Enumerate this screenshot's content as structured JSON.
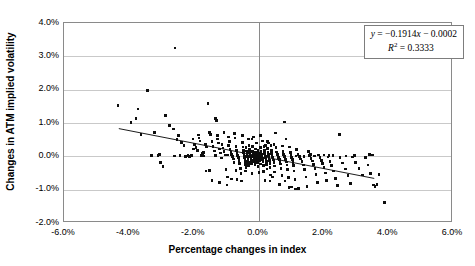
{
  "chart_data": {
    "type": "scatter",
    "title": "",
    "xlabel": "Percentage changes in index",
    "ylabel": "Changes in ATM implied volatility",
    "xlim": [
      -6.0,
      6.0
    ],
    "ylim": [
      -2.0,
      4.0
    ],
    "xticks": [
      "-6.0%",
      "-4.0%",
      "-2.0%",
      "0.0%",
      "2.0%",
      "4.0%",
      "6.0%"
    ],
    "xtick_values": [
      -6.0,
      -4.0,
      -2.0,
      0.0,
      2.0,
      4.0,
      6.0
    ],
    "yticks": [
      "-2.0%",
      "-1.0%",
      "0.0%",
      "1.0%",
      "2.0%",
      "3.0%",
      "4.0%"
    ],
    "ytick_values": [
      -2.0,
      -1.0,
      0.0,
      1.0,
      2.0,
      3.0,
      4.0
    ],
    "grid": "horizontal",
    "legend": "none",
    "marker": "square",
    "marker_color": "#0d0d0d",
    "annotation": {
      "equation": "y = -0.1914x - 0.0002",
      "r_squared": "R2 = 0.3333",
      "equation_prefix": "y",
      "equation_body": " = −0.1914",
      "equation_var": "x",
      "equation_suffix": " − 0.0002",
      "r_prefix": "R",
      "r_exp": "2",
      "r_value": " = 0.3333",
      "position": "top-right"
    },
    "trendline": {
      "slope": -0.1914,
      "intercept": -0.0002,
      "r_squared": 0.3333,
      "x_start": -4.3,
      "y_start": 0.8,
      "x_end": 3.62,
      "y_end": -0.71,
      "color": "#1a1a1a"
    },
    "points": [
      [
        -4.33,
        1.53
      ],
      [
        -3.93,
        1.02
      ],
      [
        -3.72,
        1.42
      ],
      [
        -3.78,
        1.13
      ],
      [
        -3.42,
        1.98
      ],
      [
        -3.62,
        0.66
      ],
      [
        -3.2,
        0.71
      ],
      [
        -3.05,
        0.06
      ],
      [
        -3.02,
        -0.18
      ],
      [
        -2.95,
        -0.31
      ],
      [
        -2.86,
        1.22
      ],
      [
        -2.74,
        0.92
      ],
      [
        -2.58,
        3.25
      ],
      [
        -2.62,
        0.82
      ],
      [
        -2.52,
        0.51
      ],
      [
        -2.46,
        0.62
      ],
      [
        -2.38,
        0.42
      ],
      [
        -2.3,
        0.33
      ],
      [
        -2.22,
        0.01
      ],
      [
        -2.18,
        0.02
      ],
      [
        -2.12,
        0.0
      ],
      [
        -2.07,
        0.03
      ],
      [
        -2.02,
        0.52
      ],
      [
        -1.98,
        0.35
      ],
      [
        -1.93,
        0.26
      ],
      [
        -1.88,
        0.18
      ],
      [
        -1.84,
        0.55
      ],
      [
        -1.8,
        0.46
      ],
      [
        -1.76,
        0.02
      ],
      [
        -1.72,
        0.08
      ],
      [
        -1.68,
        0.01
      ],
      [
        -1.64,
        0.35
      ],
      [
        -1.6,
        0.28
      ],
      [
        -1.56,
        1.58
      ],
      [
        -1.52,
        0.72
      ],
      [
        -1.48,
        0.66
      ],
      [
        -1.44,
        0.45
      ],
      [
        -1.4,
        0.3
      ],
      [
        -1.36,
        0.16
      ],
      [
        -1.33,
        1.13
      ],
      [
        -1.3,
        1.07
      ],
      [
        -1.27,
        0.62
      ],
      [
        -1.24,
        0.4
      ],
      [
        -1.21,
        0.22
      ],
      [
        -1.18,
        0.1
      ],
      [
        -1.15,
        -0.05
      ],
      [
        -1.12,
        0.36
      ],
      [
        -1.09,
        0.25
      ],
      [
        -1.06,
        0.14
      ],
      [
        -1.03,
        0.04
      ],
      [
        -1.0,
        -0.39
      ],
      [
        -0.97,
        -0.86
      ],
      [
        -0.95,
        -0.62
      ],
      [
        -0.92,
        0.33
      ],
      [
        -0.9,
        0.45
      ],
      [
        -0.88,
        0.21
      ],
      [
        -0.85,
        0.12
      ],
      [
        -0.83,
        0.06
      ],
      [
        -0.8,
        0.0
      ],
      [
        -0.78,
        -0.08
      ],
      [
        -0.76,
        -0.18
      ],
      [
        -0.74,
        0.68
      ],
      [
        -0.72,
        0.55
      ],
      [
        -0.7,
        0.3
      ],
      [
        -0.68,
        0.17
      ],
      [
        -0.66,
        0.08
      ],
      [
        -0.64,
        0.02
      ],
      [
        -0.62,
        -0.04
      ],
      [
        -0.6,
        -0.12
      ],
      [
        -0.58,
        -0.22
      ],
      [
        -0.56,
        -0.36
      ],
      [
        -0.54,
        -0.52
      ],
      [
        -0.52,
        -0.74
      ],
      [
        -0.5,
        0.42
      ],
      [
        -0.48,
        0.28
      ],
      [
        -0.47,
        0.19
      ],
      [
        -0.46,
        0.11
      ],
      [
        -0.45,
        0.05
      ],
      [
        -0.44,
        0.0
      ],
      [
        -0.43,
        -0.03
      ],
      [
        -0.42,
        -0.09
      ],
      [
        -0.41,
        -0.15
      ],
      [
        -0.4,
        -0.24
      ],
      [
        -0.39,
        -0.33
      ],
      [
        -0.38,
        0.26
      ],
      [
        -0.37,
        0.16
      ],
      [
        -0.36,
        0.09
      ],
      [
        -0.35,
        0.03
      ],
      [
        -0.34,
        -0.01
      ],
      [
        -0.33,
        -0.06
      ],
      [
        -0.32,
        -0.11
      ],
      [
        -0.31,
        -0.19
      ],
      [
        -0.3,
        -0.28
      ],
      [
        -0.29,
        0.33
      ],
      [
        -0.28,
        0.2
      ],
      [
        -0.27,
        0.12
      ],
      [
        -0.26,
        0.06
      ],
      [
        -0.25,
        0.01
      ],
      [
        -0.24,
        -0.02
      ],
      [
        -0.23,
        -0.07
      ],
      [
        -0.22,
        -0.13
      ],
      [
        -0.21,
        -0.21
      ],
      [
        -0.2,
        0.52
      ],
      [
        -0.19,
        0.29
      ],
      [
        -0.18,
        0.15
      ],
      [
        -0.17,
        0.08
      ],
      [
        -0.16,
        0.03
      ],
      [
        -0.15,
        0.0
      ],
      [
        -0.14,
        -0.04
      ],
      [
        -0.13,
        -0.09
      ],
      [
        -0.12,
        -0.16
      ],
      [
        -0.11,
        -0.25
      ],
      [
        -0.1,
        0.22
      ],
      [
        -0.09,
        0.11
      ],
      [
        -0.08,
        0.05
      ],
      [
        -0.07,
        0.01
      ],
      [
        -0.06,
        -0.02
      ],
      [
        -0.05,
        -0.06
      ],
      [
        -0.04,
        -0.12
      ],
      [
        -0.03,
        -0.2
      ],
      [
        -0.02,
        -0.31
      ],
      [
        -0.01,
        0.18
      ],
      [
        0.0,
        0.09
      ],
      [
        0.01,
        0.04
      ],
      [
        0.02,
        0.0
      ],
      [
        0.03,
        -0.03
      ],
      [
        0.04,
        -0.08
      ],
      [
        0.05,
        -0.14
      ],
      [
        0.06,
        -0.23
      ],
      [
        0.07,
        0.26
      ],
      [
        0.08,
        0.14
      ],
      [
        0.09,
        0.07
      ],
      [
        0.1,
        0.02
      ],
      [
        0.11,
        -0.01
      ],
      [
        0.12,
        -0.05
      ],
      [
        0.13,
        -0.1
      ],
      [
        0.14,
        -0.17
      ],
      [
        0.15,
        -0.27
      ],
      [
        0.16,
        -0.45
      ],
      [
        0.17,
        0.3
      ],
      [
        0.18,
        0.17
      ],
      [
        0.19,
        0.09
      ],
      [
        0.2,
        0.03
      ],
      [
        0.21,
        0.0
      ],
      [
        0.22,
        -0.04
      ],
      [
        0.23,
        -0.09
      ],
      [
        0.24,
        -0.15
      ],
      [
        0.25,
        -0.24
      ],
      [
        0.26,
        -0.38
      ],
      [
        0.27,
        0.44
      ],
      [
        0.28,
        0.23
      ],
      [
        0.29,
        0.12
      ],
      [
        0.3,
        0.05
      ],
      [
        0.31,
        0.01
      ],
      [
        0.32,
        -0.03
      ],
      [
        0.33,
        -0.07
      ],
      [
        0.34,
        -0.13
      ],
      [
        0.35,
        -0.21
      ],
      [
        0.36,
        -0.34
      ],
      [
        0.37,
        -0.56
      ],
      [
        0.38,
        0.33
      ],
      [
        0.4,
        0.18
      ],
      [
        0.41,
        0.08
      ],
      [
        0.42,
        0.02
      ],
      [
        0.44,
        -0.02
      ],
      [
        0.45,
        -0.06
      ],
      [
        0.46,
        -0.11
      ],
      [
        0.48,
        -0.18
      ],
      [
        0.49,
        -0.29
      ],
      [
        0.5,
        -0.47
      ],
      [
        0.52,
        0.7
      ],
      [
        0.54,
        0.26
      ],
      [
        0.56,
        0.13
      ],
      [
        0.58,
        0.05
      ],
      [
        0.6,
        0.0
      ],
      [
        0.62,
        -0.04
      ],
      [
        0.64,
        -0.09
      ],
      [
        0.66,
        -0.15
      ],
      [
        0.68,
        -0.23
      ],
      [
        0.7,
        -0.36
      ],
      [
        0.72,
        -0.58
      ],
      [
        0.74,
        0.31
      ],
      [
        0.76,
        0.15
      ],
      [
        0.78,
        0.06
      ],
      [
        0.8,
        0.0
      ],
      [
        0.82,
        -0.05
      ],
      [
        0.84,
        -0.1
      ],
      [
        0.86,
        -0.17
      ],
      [
        0.88,
        -0.26
      ],
      [
        0.9,
        -0.4
      ],
      [
        0.92,
        -0.64
      ],
      [
        0.94,
        -0.94
      ],
      [
        0.8,
        1.03
      ],
      [
        0.85,
        0.52
      ],
      [
        0.96,
        0.28
      ],
      [
        0.98,
        0.12
      ],
      [
        1.0,
        0.02
      ],
      [
        1.02,
        -0.04
      ],
      [
        1.04,
        -0.1
      ],
      [
        1.06,
        -0.18
      ],
      [
        1.08,
        -0.28
      ],
      [
        1.1,
        -0.44
      ],
      [
        1.12,
        -0.7
      ],
      [
        1.14,
        -0.98
      ],
      [
        1.18,
        0.2
      ],
      [
        1.22,
        0.06
      ],
      [
        1.26,
        -0.01
      ],
      [
        1.3,
        -0.08
      ],
      [
        1.34,
        -0.16
      ],
      [
        1.38,
        -0.26
      ],
      [
        1.42,
        -0.4
      ],
      [
        1.46,
        -0.62
      ],
      [
        1.5,
        -0.9
      ],
      [
        1.54,
        0.14
      ],
      [
        1.58,
        0.02
      ],
      [
        1.62,
        -0.06
      ],
      [
        1.66,
        -0.14
      ],
      [
        1.7,
        -0.24
      ],
      [
        1.74,
        -0.36
      ],
      [
        1.78,
        -0.54
      ],
      [
        1.82,
        -0.78
      ],
      [
        1.86,
        0.04
      ],
      [
        1.9,
        -0.03
      ],
      [
        1.94,
        -0.12
      ],
      [
        1.98,
        -0.22
      ],
      [
        2.02,
        -0.34
      ],
      [
        2.06,
        -0.5
      ],
      [
        2.1,
        -0.72
      ],
      [
        2.14,
        -0.02
      ],
      [
        2.2,
        -0.15
      ],
      [
        2.26,
        -0.28
      ],
      [
        2.32,
        -0.44
      ],
      [
        2.38,
        -0.66
      ],
      [
        2.44,
        -0.88
      ],
      [
        2.5,
        0.66
      ],
      [
        2.52,
        -0.04
      ],
      [
        2.6,
        -0.2
      ],
      [
        2.68,
        -0.38
      ],
      [
        2.76,
        -0.58
      ],
      [
        2.84,
        -0.82
      ],
      [
        2.9,
        -0.02
      ],
      [
        3.0,
        -0.18
      ],
      [
        3.1,
        -0.36
      ],
      [
        3.2,
        -0.56
      ],
      [
        3.3,
        -0.03
      ],
      [
        3.38,
        -0.26
      ],
      [
        3.46,
        -0.52
      ],
      [
        3.54,
        -0.86
      ],
      [
        3.6,
        -0.9
      ],
      [
        3.66,
        -0.84
      ],
      [
        3.72,
        -0.54
      ],
      [
        3.88,
        -1.38
      ],
      [
        3.42,
        0.05
      ],
      [
        2.96,
        0.03
      ],
      [
        2.18,
        0.02
      ],
      [
        1.72,
        0.01
      ],
      [
        1.4,
        0.0
      ],
      [
        1.16,
        0.01
      ],
      [
        -2.26,
        0.0
      ],
      [
        -2.42,
        0.02
      ],
      [
        -2.6,
        0.01
      ],
      [
        -3.1,
        0.02
      ],
      [
        -1.52,
        -0.42
      ],
      [
        -1.44,
        -0.72
      ],
      [
        -1.2,
        -0.78
      ],
      [
        -0.84,
        -0.68
      ],
      [
        -0.66,
        -0.7
      ],
      [
        -1.62,
        -0.44
      ],
      [
        0.2,
        -0.72
      ],
      [
        0.36,
        -0.74
      ],
      [
        0.64,
        -0.84
      ],
      [
        1.02,
        -0.92
      ],
      [
        1.24,
        -0.96
      ],
      [
        -0.5,
        0.62
      ],
      [
        -0.3,
        0.52
      ],
      [
        0.12,
        0.46
      ],
      [
        0.3,
        0.4
      ],
      [
        0.48,
        0.36
      ],
      [
        -2.0,
        0.22
      ],
      [
        -1.86,
        0.64
      ],
      [
        -1.26,
        0.52
      ],
      [
        -1.06,
        0.72
      ],
      [
        -0.92,
        0.58
      ],
      [
        2.02,
        0.04
      ],
      [
        1.6,
        0.05
      ],
      [
        -0.16,
        0.58
      ],
      [
        0.06,
        0.62
      ],
      [
        -0.06,
        0.4
      ],
      [
        0.22,
        0.33
      ],
      [
        -0.7,
        -0.42
      ],
      [
        -0.4,
        -0.44
      ],
      [
        -0.2,
        -0.52
      ],
      [
        0.02,
        -0.48
      ],
      [
        0.44,
        -0.62
      ],
      [
        0.82,
        -0.74
      ],
      [
        -1.7,
        0.12
      ],
      [
        -1.32,
        0.02
      ],
      [
        -0.96,
        0.04
      ],
      [
        2.3,
        0.02
      ],
      [
        2.7,
        0.01
      ],
      [
        3.52,
        0.04
      ],
      [
        -3.3,
        0.03
      ]
    ]
  }
}
